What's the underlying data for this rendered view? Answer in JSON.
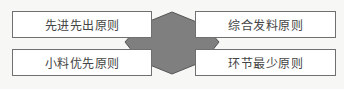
{
  "diagram": {
    "center_shape": {
      "type": "hexagon",
      "fill": "#7f7f7f",
      "stroke": "#555555"
    },
    "boxes": [
      {
        "label": "先进先出原则",
        "position": "top-left"
      },
      {
        "label": "小料优先原则",
        "position": "bottom-left"
      },
      {
        "label": "综合发料原则",
        "position": "top-right"
      },
      {
        "label": "环节最少原则",
        "position": "bottom-right"
      }
    ]
  }
}
